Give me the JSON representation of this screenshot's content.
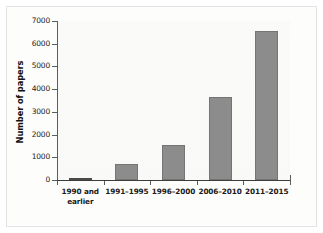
{
  "chart_data": {
    "type": "bar",
    "title": "",
    "xlabel": "",
    "ylabel": "Number of papers",
    "categories": [
      "1990 and\nearlier",
      "1991–1995",
      "1996–2000",
      "2006–2010",
      "2011–2015"
    ],
    "values": [
      0,
      720,
      1550,
      3670,
      6550
    ],
    "ylim": [
      0,
      7000
    ],
    "yticks": [
      0,
      1000,
      2000,
      3000,
      4000,
      5000,
      6000,
      7000
    ],
    "ytick_labels": [
      "0",
      "1000",
      "2000",
      "3000",
      "4000",
      "5000",
      "6000",
      "7000"
    ],
    "grid": false,
    "legend": null,
    "bar_color": "#8c8c8c",
    "bar_edge_color": "#757575",
    "axis_color": "#3d3d3d",
    "plot_background": "#fbfbfa",
    "figure_background": "#fdfdfc",
    "frame_border_color": "#e3e3e3"
  }
}
